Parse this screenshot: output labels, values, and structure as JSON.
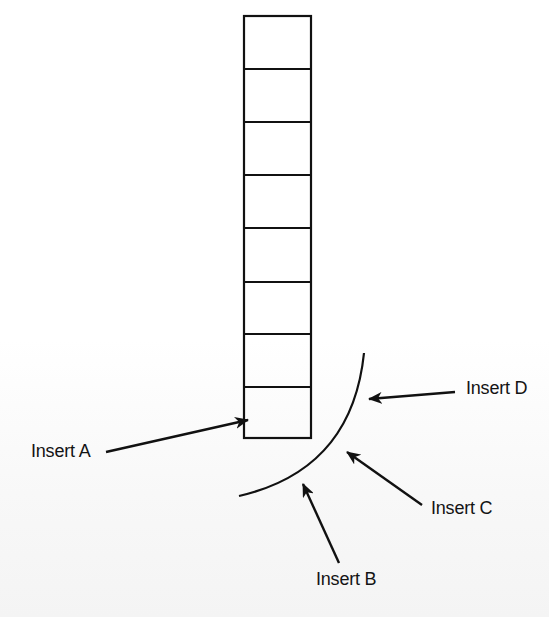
{
  "diagram": {
    "type": "stack-insertion-points",
    "background": "#ffffff",
    "stroke_color": "#111111",
    "stack": {
      "cell_count": 8,
      "x": 244,
      "y": 16,
      "width": 68,
      "height": 423
    },
    "curve": {
      "description": "arc bulging toward lower-right, below and right of the stack",
      "path": "M 364 353 Q 352 470 239 496"
    },
    "labels": {
      "insert_a": "Insert A",
      "insert_b": "Insert B",
      "insert_c": "Insert C",
      "insert_d": "Insert D"
    },
    "arrows": [
      {
        "id": "insert_a",
        "from": [
          106,
          452
        ],
        "to": [
          248,
          420
        ],
        "target": "bottom cell of stack (left side)"
      },
      {
        "id": "insert_b",
        "from": [
          339,
          563
        ],
        "to": [
          303,
          484
        ],
        "target": "curve (lower part)"
      },
      {
        "id": "insert_c",
        "from": [
          422,
          505
        ],
        "to": [
          347,
          452
        ],
        "target": "curve (middle)"
      },
      {
        "id": "insert_d",
        "from": [
          455,
          392
        ],
        "to": [
          369,
          399
        ],
        "target": "curve (upper part)"
      }
    ]
  }
}
